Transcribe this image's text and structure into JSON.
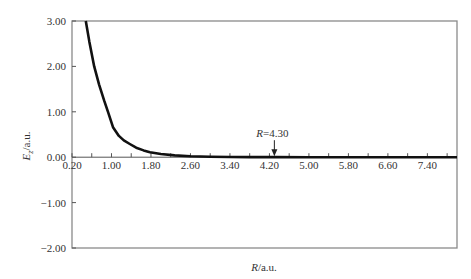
{
  "chart_data": {
    "type": "line",
    "title": "",
    "xlabel": "R/a.u.",
    "ylabel": "E_z/a.u.",
    "xlabel_parts": {
      "italic": "R",
      "rest": "/a.u."
    },
    "ylabel_parts": {
      "italic": "E",
      "sub": "z",
      "rest": "/a.u."
    },
    "xlim": [
      0.2,
      8.0
    ],
    "ylim": [
      -2.0,
      3.0
    ],
    "x_ticks": [
      "0.20",
      "1.00",
      "1.80",
      "2.60",
      "3.40",
      "4.20",
      "5.00",
      "5.80",
      "6.60",
      "7.40"
    ],
    "x_tick_values": [
      0.2,
      1.0,
      1.8,
      2.6,
      3.4,
      4.2,
      5.0,
      5.8,
      6.6,
      7.4
    ],
    "y_ticks": [
      "3.00",
      "2.00",
      "1.00",
      "0.00",
      "-1.00",
      "-2.00"
    ],
    "y_tick_values": [
      3.0,
      2.0,
      1.0,
      0.0,
      -1.0,
      -2.0
    ],
    "grid": false,
    "legend": null,
    "series": [
      {
        "name": "E_z",
        "color": "#111111",
        "x": [
          0.48,
          0.55,
          0.65,
          0.75,
          0.85,
          0.93,
          1.03,
          1.15,
          1.25,
          1.37,
          1.5,
          1.65,
          1.78,
          2.0,
          2.28,
          2.6,
          3.0,
          3.4,
          3.8,
          4.3,
          5.0,
          5.8,
          6.6,
          7.4,
          8.0
        ],
        "y": [
          3.0,
          2.55,
          2.0,
          1.6,
          1.25,
          1.0,
          0.66,
          0.47,
          0.37,
          0.29,
          0.21,
          0.15,
          0.11,
          0.07,
          0.04,
          0.02,
          0.01,
          0.005,
          0.003,
          0.002,
          0.001,
          0.0,
          0.0,
          0.0,
          0.0
        ]
      }
    ],
    "annotations": [
      {
        "text": "R=4.30",
        "italic": "R",
        "rest": "=4.30",
        "x": 4.3,
        "y": 0.0,
        "arrow": "down"
      }
    ]
  }
}
